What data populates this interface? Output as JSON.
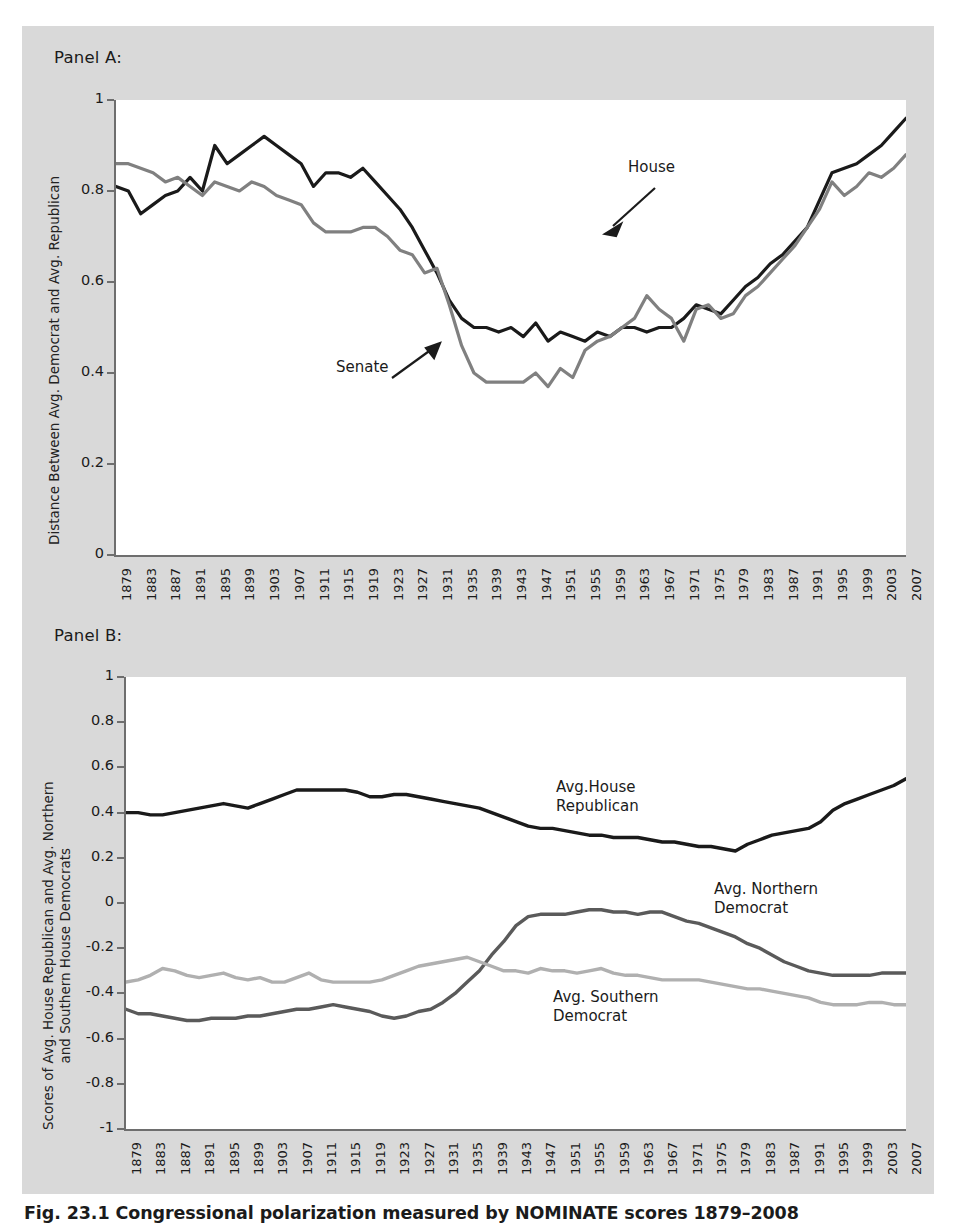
{
  "figure": {
    "caption": "Fig. 23.1  Congressional polarization measured by NOMINATE scores 1879–2008",
    "panel_a_label": "Panel A:",
    "panel_b_label": "Panel B:"
  },
  "colors": {
    "background": "#d9d9d9",
    "plot_background": "#ffffff",
    "axis": "#6e6e6e",
    "house_black": "#1a1a1a",
    "senate_gray": "#808080",
    "north_dem_gray": "#5a5a5a",
    "south_dem_gray": "#b0b0b0",
    "text": "#1b1b1b"
  },
  "chart_data": [
    {
      "type": "line",
      "panel": "Panel A:",
      "title": "",
      "xlabel": "",
      "ylabel": "Distance Between Avg. Democrat and Avg. Republican",
      "xlim": [
        1879,
        2007
      ],
      "ylim": [
        0,
        1
      ],
      "yticks": [
        "0",
        "0.2",
        "0.4",
        "0.6",
        "0.8",
        "1"
      ],
      "ytick_values": [
        0,
        0.2,
        0.4,
        0.6,
        0.8,
        1
      ],
      "grid": false,
      "legend": "inline-annotations",
      "annotations": [
        {
          "text": "House",
          "x_label": 1967,
          "y_value": 0.78
        },
        {
          "text": "Senate",
          "x_label": 1939,
          "y_value": 0.43
        }
      ],
      "x": [
        1879,
        1881,
        1883,
        1885,
        1887,
        1889,
        1891,
        1893,
        1895,
        1897,
        1899,
        1901,
        1903,
        1905,
        1907,
        1909,
        1911,
        1913,
        1915,
        1917,
        1919,
        1921,
        1923,
        1925,
        1927,
        1929,
        1931,
        1933,
        1935,
        1937,
        1939,
        1941,
        1943,
        1945,
        1947,
        1949,
        1951,
        1953,
        1955,
        1957,
        1959,
        1961,
        1963,
        1965,
        1967,
        1969,
        1971,
        1973,
        1975,
        1977,
        1979,
        1981,
        1983,
        1985,
        1987,
        1989,
        1991,
        1993,
        1995,
        1997,
        1999,
        2001,
        2003,
        2005,
        2007
      ],
      "series": [
        {
          "name": "House",
          "color": "#1a1a1a",
          "values": [
            0.81,
            0.8,
            0.75,
            0.77,
            0.79,
            0.8,
            0.83,
            0.8,
            0.9,
            0.86,
            0.88,
            0.9,
            0.92,
            0.9,
            0.88,
            0.86,
            0.81,
            0.84,
            0.84,
            0.83,
            0.85,
            0.82,
            0.79,
            0.76,
            0.72,
            0.67,
            0.62,
            0.56,
            0.52,
            0.5,
            0.5,
            0.49,
            0.5,
            0.48,
            0.51,
            0.47,
            0.49,
            0.48,
            0.47,
            0.49,
            0.48,
            0.5,
            0.5,
            0.49,
            0.5,
            0.5,
            0.52,
            0.55,
            0.54,
            0.53,
            0.56,
            0.59,
            0.61,
            0.64,
            0.66,
            0.69,
            0.72,
            0.78,
            0.84,
            0.85,
            0.86,
            0.88,
            0.9,
            0.93,
            0.96
          ]
        },
        {
          "name": "Senate",
          "color": "#808080",
          "values": [
            0.86,
            0.86,
            0.85,
            0.84,
            0.82,
            0.83,
            0.81,
            0.79,
            0.82,
            0.81,
            0.8,
            0.82,
            0.81,
            0.79,
            0.78,
            0.77,
            0.73,
            0.71,
            0.71,
            0.71,
            0.72,
            0.72,
            0.7,
            0.67,
            0.66,
            0.62,
            0.63,
            0.55,
            0.46,
            0.4,
            0.38,
            0.38,
            0.38,
            0.38,
            0.4,
            0.37,
            0.41,
            0.39,
            0.45,
            0.47,
            0.48,
            0.5,
            0.52,
            0.57,
            0.54,
            0.52,
            0.47,
            0.54,
            0.55,
            0.52,
            0.53,
            0.57,
            0.59,
            0.62,
            0.65,
            0.68,
            0.72,
            0.76,
            0.82,
            0.79,
            0.81,
            0.84,
            0.83,
            0.85,
            0.88
          ]
        }
      ]
    },
    {
      "type": "line",
      "panel": "Panel B:",
      "title": "",
      "xlabel": "",
      "ylabel": "Scores of Avg. House Republican and Avg. Northern and Southern House Democrats",
      "ylabel_line1": "Scores of Avg. House Republican and Avg. Northern",
      "ylabel_line2": "and Southern House Democrats",
      "xlim": [
        1879,
        2007
      ],
      "ylim": [
        -1,
        1
      ],
      "yticks": [
        "-1",
        "-0.8",
        "-0.6",
        "-0.4",
        "-0.2",
        "0",
        "0.2",
        "0.4",
        "0.6",
        "0.8",
        "1"
      ],
      "ytick_values": [
        -1,
        -0.8,
        -0.6,
        -0.4,
        -0.2,
        0,
        0.2,
        0.4,
        0.6,
        0.8,
        1
      ],
      "grid": false,
      "legend": "inline-annotations",
      "annotations": [
        {
          "text": "Avg.House\nRepublican",
          "x_label": 1955,
          "y_value": 0.44
        },
        {
          "text": "Avg. Northern\nDemocrat",
          "x_label": 1983,
          "y_value": -0.06
        },
        {
          "text": "Avg. Southern\nDemocrat",
          "x_label": 1963,
          "y_value": -0.55
        }
      ],
      "x": [
        1879,
        1881,
        1883,
        1885,
        1887,
        1889,
        1891,
        1893,
        1895,
        1897,
        1899,
        1901,
        1903,
        1905,
        1907,
        1909,
        1911,
        1913,
        1915,
        1917,
        1919,
        1921,
        1923,
        1925,
        1927,
        1929,
        1931,
        1933,
        1935,
        1937,
        1939,
        1941,
        1943,
        1945,
        1947,
        1949,
        1951,
        1953,
        1955,
        1957,
        1959,
        1961,
        1963,
        1965,
        1967,
        1969,
        1971,
        1973,
        1975,
        1977,
        1979,
        1981,
        1983,
        1985,
        1987,
        1989,
        1991,
        1993,
        1995,
        1997,
        1999,
        2001,
        2003,
        2005,
        2007
      ],
      "series": [
        {
          "name": "Avg.House Republican",
          "color": "#1a1a1a",
          "values": [
            0.4,
            0.4,
            0.39,
            0.39,
            0.4,
            0.41,
            0.42,
            0.43,
            0.44,
            0.43,
            0.42,
            0.44,
            0.46,
            0.48,
            0.5,
            0.5,
            0.5,
            0.5,
            0.5,
            0.49,
            0.47,
            0.47,
            0.48,
            0.48,
            0.47,
            0.46,
            0.45,
            0.44,
            0.43,
            0.42,
            0.4,
            0.38,
            0.36,
            0.34,
            0.33,
            0.33,
            0.32,
            0.31,
            0.3,
            0.3,
            0.29,
            0.29,
            0.29,
            0.28,
            0.27,
            0.27,
            0.26,
            0.25,
            0.25,
            0.24,
            0.23,
            0.26,
            0.28,
            0.3,
            0.31,
            0.32,
            0.33,
            0.36,
            0.41,
            0.44,
            0.46,
            0.48,
            0.5,
            0.52,
            0.55
          ]
        },
        {
          "name": "Avg. Northern Democrat",
          "color": "#5a5a5a",
          "values": [
            -0.47,
            -0.49,
            -0.49,
            -0.5,
            -0.51,
            -0.52,
            -0.52,
            -0.51,
            -0.51,
            -0.51,
            -0.5,
            -0.5,
            -0.49,
            -0.48,
            -0.47,
            -0.47,
            -0.46,
            -0.45,
            -0.46,
            -0.47,
            -0.48,
            -0.5,
            -0.51,
            -0.5,
            -0.48,
            -0.47,
            -0.44,
            -0.4,
            -0.35,
            -0.3,
            -0.23,
            -0.17,
            -0.1,
            -0.06,
            -0.05,
            -0.05,
            -0.05,
            -0.04,
            -0.03,
            -0.03,
            -0.04,
            -0.04,
            -0.05,
            -0.04,
            -0.04,
            -0.06,
            -0.08,
            -0.09,
            -0.11,
            -0.13,
            -0.15,
            -0.18,
            -0.2,
            -0.23,
            -0.26,
            -0.28,
            -0.3,
            -0.31,
            -0.32,
            -0.32,
            -0.32,
            -0.32,
            -0.31,
            -0.31,
            -0.31
          ]
        },
        {
          "name": "Avg. Southern Democrat",
          "color": "#b0b0b0",
          "values": [
            -0.35,
            -0.34,
            -0.32,
            -0.29,
            -0.3,
            -0.32,
            -0.33,
            -0.32,
            -0.31,
            -0.33,
            -0.34,
            -0.33,
            -0.35,
            -0.35,
            -0.33,
            -0.31,
            -0.34,
            -0.35,
            -0.35,
            -0.35,
            -0.35,
            -0.34,
            -0.32,
            -0.3,
            -0.28,
            -0.27,
            -0.26,
            -0.25,
            -0.24,
            -0.26,
            -0.28,
            -0.3,
            -0.3,
            -0.31,
            -0.29,
            -0.3,
            -0.3,
            -0.31,
            -0.3,
            -0.29,
            -0.31,
            -0.32,
            -0.32,
            -0.33,
            -0.34,
            -0.34,
            -0.34,
            -0.34,
            -0.35,
            -0.36,
            -0.37,
            -0.38,
            -0.38,
            -0.39,
            -0.4,
            -0.41,
            -0.42,
            -0.44,
            -0.45,
            -0.45,
            -0.45,
            -0.44,
            -0.44,
            -0.45,
            -0.45
          ]
        }
      ]
    }
  ],
  "xticks": [
    "1879",
    "1883",
    "1887",
    "1891",
    "1895",
    "1899",
    "1903",
    "1907",
    "1911",
    "1915",
    "1919",
    "1923",
    "1927",
    "1931",
    "1935",
    "1939",
    "1943",
    "1947",
    "1951",
    "1955",
    "1959",
    "1963",
    "1967",
    "1971",
    "1975",
    "1979",
    "1983",
    "1987",
    "1991",
    "1995",
    "1999",
    "2003",
    "2007"
  ]
}
